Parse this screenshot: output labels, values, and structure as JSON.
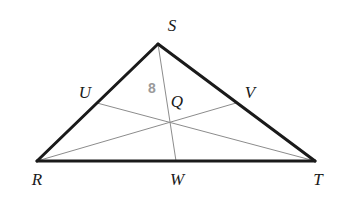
{
  "figure": {
    "kind": "geometry-diagram",
    "width": 337,
    "height": 199,
    "background_color": "#ffffff"
  },
  "style": {
    "triangle_stroke_color": "#1a1a1a",
    "triangle_stroke_width": 3,
    "median_stroke_color": "#8c8c8c",
    "median_stroke_width": 1,
    "vertex_label_color": "#1a1a1a",
    "measure_label_color": "#9a9a9a"
  },
  "points": {
    "S": {
      "label": "S",
      "x": 158,
      "y": 44,
      "label_x": 172,
      "label_y": 25
    },
    "R": {
      "label": "R",
      "x": 37,
      "y": 161,
      "label_x": 37,
      "label_y": 179
    },
    "T": {
      "label": "T",
      "x": 315,
      "y": 161,
      "label_x": 318,
      "label_y": 179
    },
    "U": {
      "label": "U",
      "x": 97,
      "y": 103,
      "label_x": 85,
      "label_y": 92
    },
    "V": {
      "label": "V",
      "x": 236,
      "y": 103,
      "label_x": 250,
      "label_y": 92
    },
    "W": {
      "label": "W",
      "x": 176,
      "y": 161,
      "label_x": 177,
      "label_y": 179
    },
    "Q": {
      "label": "Q",
      "x": 169,
      "y": 123,
      "label_x": 177,
      "label_y": 101
    }
  },
  "segments": {
    "triangle_sides": [
      {
        "name": "RS",
        "from": "R",
        "to": "S"
      },
      {
        "name": "ST",
        "from": "S",
        "to": "T"
      },
      {
        "name": "RT",
        "from": "R",
        "to": "T"
      }
    ],
    "medians": [
      {
        "name": "SW",
        "from": "S",
        "to": "W"
      },
      {
        "name": "RV",
        "from": "R",
        "to": "V"
      },
      {
        "name": "TU",
        "from": "T",
        "to": "U"
      }
    ]
  },
  "measures": [
    {
      "name": "SQ",
      "value": "8",
      "x": 152,
      "y": 88
    }
  ]
}
